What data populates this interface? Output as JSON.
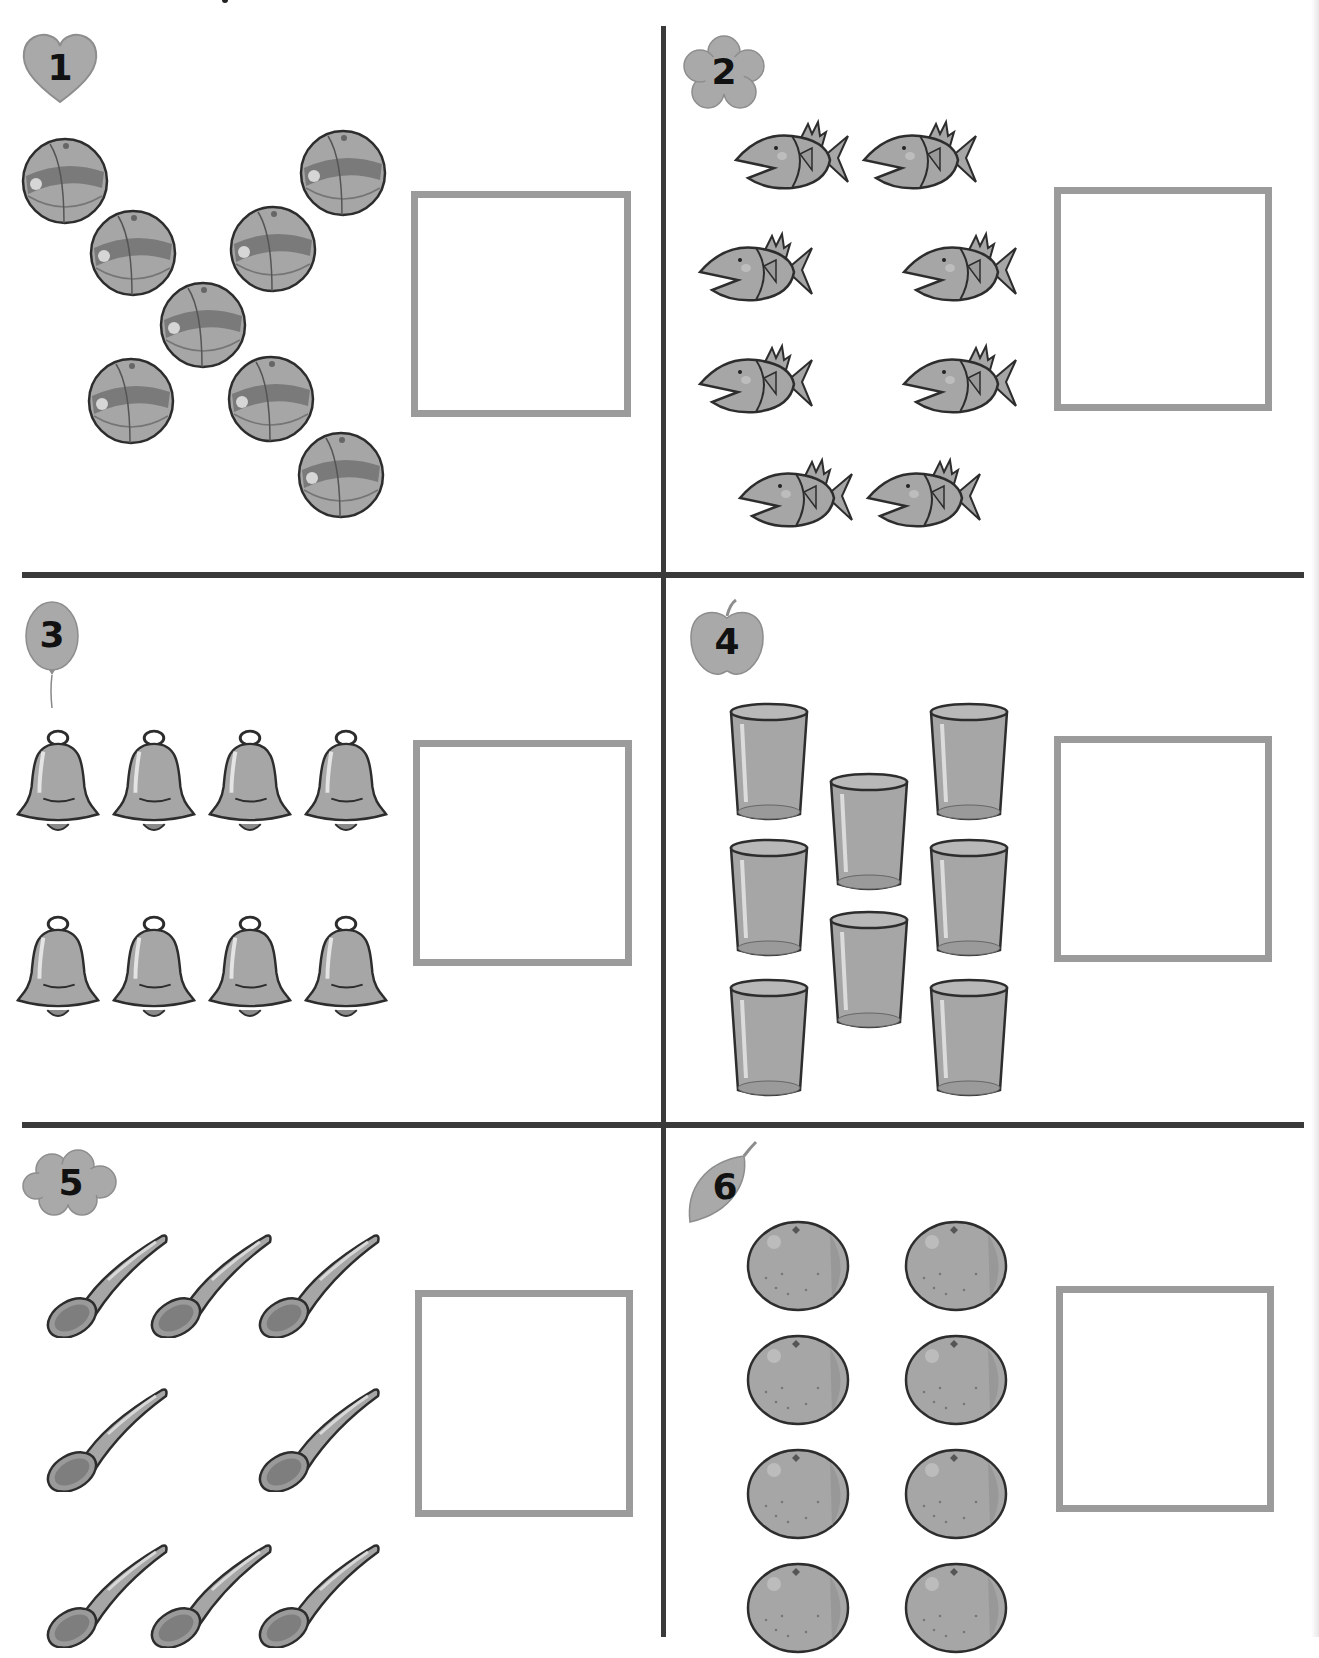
{
  "worksheet": {
    "instruction_fragment": "",
    "colors": {
      "divider": "#3a3a3a",
      "answer_box_border": "#9b9b9b",
      "badge_fill": "#a9a9a9",
      "item_fill": "#a6a6a6",
      "item_stroke": "#2d2d2d"
    },
    "problems": [
      {
        "number": "1",
        "badge_shape": "heart-icon",
        "item": "beach-ball",
        "count": 8,
        "layout": "X pattern",
        "answer": ""
      },
      {
        "number": "2",
        "badge_shape": "flower-icon",
        "item": "fish",
        "count": 8,
        "layout": "2-1+1-1+1-2 ring",
        "answer": ""
      },
      {
        "number": "3",
        "badge_shape": "balloon-icon",
        "item": "bell",
        "count": 8,
        "layout": "2 rows of 4",
        "answer": ""
      },
      {
        "number": "4",
        "badge_shape": "apple-icon",
        "item": "cup",
        "count": 8,
        "layout": "3 columns: 3-2-3",
        "answer": ""
      },
      {
        "number": "5",
        "badge_shape": "cloud-icon",
        "item": "spoon",
        "count": 8,
        "layout": "rows: 3-2-3",
        "answer": ""
      },
      {
        "number": "6",
        "badge_shape": "leaf-icon",
        "item": "orange",
        "count": 8,
        "layout": "2 columns of 4",
        "answer": ""
      }
    ]
  }
}
